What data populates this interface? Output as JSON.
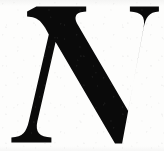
{
  "image": {
    "kind": "scanned-decorative-initial",
    "character": "N",
    "style": "italic serif capital, drop cap / illuminated initial",
    "alt_text": "Large black italic serif capital letter N on white paper",
    "width": 164,
    "height": 151
  },
  "colors": {
    "ink": "#0a0a0a",
    "paper": "#fdfdfc",
    "speckle": "#a8a8a8"
  },
  "glyph": {
    "label": "N",
    "viewbox": "0 0 164 151",
    "ink_fill": "#0a0a0a",
    "metrics": {
      "top_serif_left_x1": 36,
      "top_serif_left_x2": 86,
      "top_serif_right_x1": 117,
      "top_serif_right_x2": 159,
      "top_y": 6,
      "bottom_serif_left_x1": 11,
      "bottom_serif_left_x2": 58,
      "bottom_serif_right_x1": 95,
      "bottom_serif_right_x2": 138,
      "baseline_y": 143,
      "diagonal_join_y": 78
    },
    "path": "M 36.4 6.6 L 86.2 6.6 L 86.2 11.6 C 80.4 11.9 77.2 13.3 76.0 15.8 C 75.1 17.7 75.4 20.1 76.9 23.2 L 128.2 111.0 L 143.6 27.5 C 144.6 21.9 144.0 18.0 141.8 15.6 C 139.7 13.3 135.7 11.9 129.9 11.6 L 129.9 6.6 L 158.9 6.6 L 158.9 11.6 C 154.0 12.0 150.5 13.4 148.3 15.9 C 146.2 18.3 144.6 22.3 143.6 28.0 L 122.1 143.6 L 115.0 143.6 L 55.6 42.1 L 37.4 121.3 C 36.2 126.8 36.7 130.7 38.9 133.2 C 41.1 135.7 45.3 137.1 51.4 137.5 L 51.4 142.6 L 11.4 142.6 L 11.4 137.5 C 17.0 137.1 21.0 135.7 23.4 133.2 C 25.8 130.7 27.7 126.6 28.9 120.9 L 48.8 34.4 C 46.3 29.3 43.9 25.5 41.6 22.9 C 39.4 20.3 36.9 18.6 34.2 17.8 C 32.4 17.2 30.0 16.8 27.1 16.6 L 27.1 11.6 Z"
  },
  "render_hints": {
    "background": "white paper with faint grey scan speckle",
    "ink_edges": "slightly soft / anti-aliased as in a low-resolution scan",
    "serif_style": "flat slab top serifs with concave bracketing, splayed flat-based feet"
  }
}
